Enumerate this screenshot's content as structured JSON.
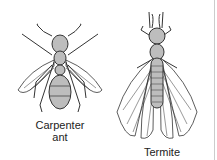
{
  "figures": [
    {
      "name": "carpenter-ant",
      "label_line1": "Carpenter",
      "label_line2": "ant"
    },
    {
      "name": "termite",
      "label_line1": "Termite"
    }
  ],
  "colors": {
    "body_fill": "#bdbdbd",
    "stroke": "#333333"
  }
}
